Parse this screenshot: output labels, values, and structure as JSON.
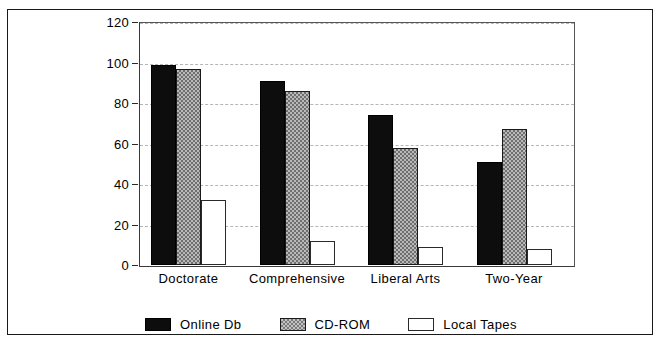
{
  "chart_data": {
    "type": "bar",
    "title": "",
    "subtitle": "",
    "xlabel": "",
    "ylabel": "",
    "categories": [
      "Doctorate",
      "Comprehensive",
      "Liberal Arts",
      "Two-Year"
    ],
    "series": [
      {
        "name": "Online Db",
        "values": [
          99,
          91,
          74,
          51
        ],
        "pattern": "solid-black",
        "color": "#0d0d0d"
      },
      {
        "name": "CD-ROM",
        "values": [
          97,
          86,
          58,
          67
        ],
        "pattern": "checker-gray",
        "color": "#b9b9b9"
      },
      {
        "name": "Local Tapes",
        "values": [
          32,
          12,
          9,
          8
        ],
        "pattern": "open-white",
        "color": "#ffffff"
      }
    ],
    "ylim": [
      0,
      120
    ],
    "ytick_step": 20,
    "yticks": [
      0,
      20,
      40,
      60,
      80,
      100,
      120
    ],
    "ytick_labels": [
      "0",
      "20",
      "40",
      "60",
      "80",
      "100",
      "120"
    ],
    "grid": true,
    "grid_style": "dashed",
    "grid_color": "#b5b5b5",
    "legend_position": "bottom",
    "frame": true,
    "frame_color": "#1a1a1a",
    "background": "#ffffff"
  }
}
